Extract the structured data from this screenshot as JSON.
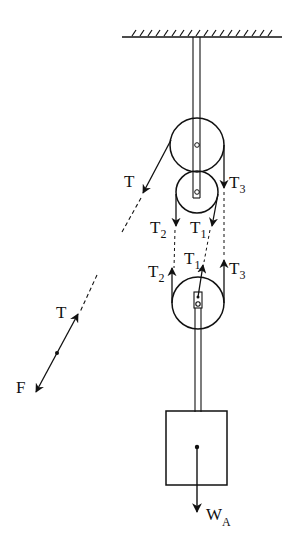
{
  "diagram": {
    "colors": {
      "stroke": "#111111",
      "background": "#ffffff"
    },
    "ceiling": {
      "label": "support"
    },
    "labels": {
      "t_upper": {
        "main": "T",
        "sub": ""
      },
      "t3_upper": {
        "main": "T",
        "sub": "3"
      },
      "t2_mid": {
        "main": "T",
        "sub": "2"
      },
      "t1_mid": {
        "main": "T",
        "sub": "1"
      },
      "t1_lower": {
        "main": "T",
        "sub": "1"
      },
      "t2_lower": {
        "main": "T",
        "sub": "2"
      },
      "t3_lower": {
        "main": "T",
        "sub": "3"
      },
      "t_free": {
        "main": "T",
        "sub": ""
      },
      "f": {
        "main": "F",
        "sub": ""
      },
      "wa": {
        "main": "W",
        "sub": "A"
      }
    }
  }
}
